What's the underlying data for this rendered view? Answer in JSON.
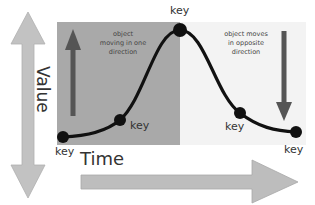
{
  "diagram": {
    "type": "animation-keyframe-curve",
    "axes": {
      "vertical_label": "Value",
      "horizontal_label": "Time"
    },
    "regions": [
      {
        "name": "rising",
        "note": [
          "object",
          "moving in one",
          "direction"
        ],
        "color": "#a9a9a9",
        "arrow": "up"
      },
      {
        "name": "falling",
        "note": [
          "object moves",
          "in opposite",
          "direction"
        ],
        "color": "#f3f3f3",
        "arrow": "down"
      }
    ],
    "keyframes": [
      {
        "label": "key",
        "x": 63,
        "y": 137
      },
      {
        "label": "key",
        "x": 120,
        "y": 120
      },
      {
        "label": "key",
        "x": 180,
        "y": 30
      },
      {
        "label": "key",
        "x": 240,
        "y": 113
      },
      {
        "label": "key",
        "x": 296,
        "y": 132
      }
    ],
    "colors": {
      "curve": "#111111",
      "axis_arrow": "#b9b9b9",
      "direction_arrow": "#555555"
    }
  }
}
